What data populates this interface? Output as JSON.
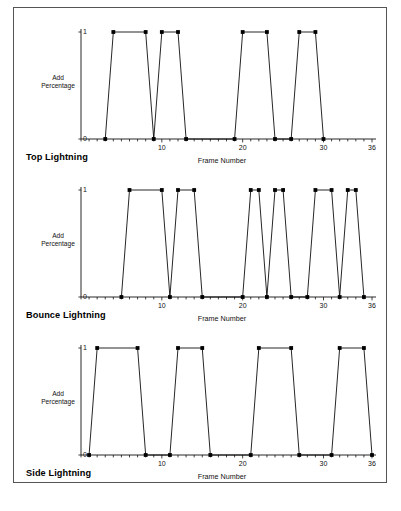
{
  "figure": {
    "caption": "",
    "border_color": "#555555",
    "line_color": "#000000",
    "marker_color": "#000000",
    "background": "#ffffff"
  },
  "axis": {
    "x_label": "Frame Number",
    "y_label_line1": "Add",
    "y_label_line2": "Percentage",
    "y_ticks": [
      "0",
      "1"
    ],
    "x_ticks": [
      "10",
      "20",
      "30",
      "36"
    ],
    "x_tick_values": [
      10,
      20,
      30,
      36
    ],
    "x_min": 0,
    "x_max": 36,
    "y_min": 0,
    "y_max": 1,
    "x_minor_tick_step": 1,
    "grid": false,
    "legend": "none"
  },
  "chart_data": [
    {
      "type": "line",
      "title": "Top Lightning",
      "xlabel": "Frame Number",
      "ylabel": "Add Percentage",
      "xlim": [
        0,
        36
      ],
      "ylim": [
        0,
        1
      ],
      "x": [
        3,
        4,
        8,
        9,
        10,
        12,
        13,
        19,
        20,
        23,
        24,
        26,
        27,
        29,
        30
      ],
      "y": [
        0,
        1,
        1,
        0,
        1,
        1,
        0,
        0,
        1,
        1,
        0,
        0,
        1,
        1,
        0
      ],
      "marker": "square",
      "series": [
        {
          "name": "Top Lightning",
          "points": [
            {
              "x": 3,
              "y": 0
            },
            {
              "x": 4,
              "y": 1
            },
            {
              "x": 8,
              "y": 1
            },
            {
              "x": 9,
              "y": 0
            },
            {
              "x": 10,
              "y": 1
            },
            {
              "x": 12,
              "y": 1
            },
            {
              "x": 13,
              "y": 0
            },
            {
              "x": 19,
              "y": 0
            },
            {
              "x": 20,
              "y": 1
            },
            {
              "x": 23,
              "y": 1
            },
            {
              "x": 24,
              "y": 0
            },
            {
              "x": 26,
              "y": 0
            },
            {
              "x": 27,
              "y": 1
            },
            {
              "x": 29,
              "y": 1
            },
            {
              "x": 30,
              "y": 0
            }
          ]
        }
      ]
    },
    {
      "type": "line",
      "title": "Bounce Lightning",
      "xlabel": "Frame Number",
      "ylabel": "Add Percentage",
      "xlim": [
        0,
        36
      ],
      "ylim": [
        0,
        1
      ],
      "x": [
        5,
        6,
        10,
        11,
        12,
        14,
        15,
        20,
        21,
        22,
        23,
        24,
        25,
        26,
        28,
        29,
        31,
        32,
        33,
        34,
        35
      ],
      "y": [
        0,
        1,
        1,
        0,
        1,
        1,
        0,
        0,
        1,
        1,
        0,
        1,
        1,
        0,
        0,
        1,
        1,
        0,
        1,
        1,
        0
      ],
      "marker": "square",
      "series": [
        {
          "name": "Bounce Lightning",
          "points": [
            {
              "x": 5,
              "y": 0
            },
            {
              "x": 6,
              "y": 1
            },
            {
              "x": 10,
              "y": 1
            },
            {
              "x": 11,
              "y": 0
            },
            {
              "x": 12,
              "y": 1
            },
            {
              "x": 14,
              "y": 1
            },
            {
              "x": 15,
              "y": 0
            },
            {
              "x": 20,
              "y": 0
            },
            {
              "x": 21,
              "y": 1
            },
            {
              "x": 22,
              "y": 1
            },
            {
              "x": 23,
              "y": 0
            },
            {
              "x": 24,
              "y": 1
            },
            {
              "x": 25,
              "y": 1
            },
            {
              "x": 26,
              "y": 0
            },
            {
              "x": 28,
              "y": 0
            },
            {
              "x": 29,
              "y": 1
            },
            {
              "x": 31,
              "y": 1
            },
            {
              "x": 32,
              "y": 0
            },
            {
              "x": 33,
              "y": 1
            },
            {
              "x": 34,
              "y": 1
            },
            {
              "x": 35,
              "y": 0
            }
          ]
        }
      ]
    },
    {
      "type": "line",
      "title": "Side Lightning",
      "xlabel": "Frame Number",
      "ylabel": "Add Percentage",
      "xlim": [
        0,
        36
      ],
      "ylim": [
        0,
        1
      ],
      "x": [
        1,
        2,
        7,
        8,
        11,
        12,
        15,
        16,
        21,
        22,
        26,
        27,
        31,
        32,
        35,
        36
      ],
      "y": [
        0,
        1,
        1,
        0,
        0,
        1,
        1,
        0,
        0,
        1,
        1,
        0,
        0,
        1,
        1,
        0
      ],
      "marker": "square",
      "series": [
        {
          "name": "Side Lightning",
          "points": [
            {
              "x": 1,
              "y": 0
            },
            {
              "x": 2,
              "y": 1
            },
            {
              "x": 7,
              "y": 1
            },
            {
              "x": 8,
              "y": 0
            },
            {
              "x": 11,
              "y": 0
            },
            {
              "x": 12,
              "y": 1
            },
            {
              "x": 15,
              "y": 1
            },
            {
              "x": 16,
              "y": 0
            },
            {
              "x": 21,
              "y": 0
            },
            {
              "x": 22,
              "y": 1
            },
            {
              "x": 26,
              "y": 1
            },
            {
              "x": 27,
              "y": 0
            },
            {
              "x": 31,
              "y": 0
            },
            {
              "x": 32,
              "y": 1
            },
            {
              "x": 35,
              "y": 1
            },
            {
              "x": 36,
              "y": 0
            }
          ]
        }
      ]
    }
  ]
}
